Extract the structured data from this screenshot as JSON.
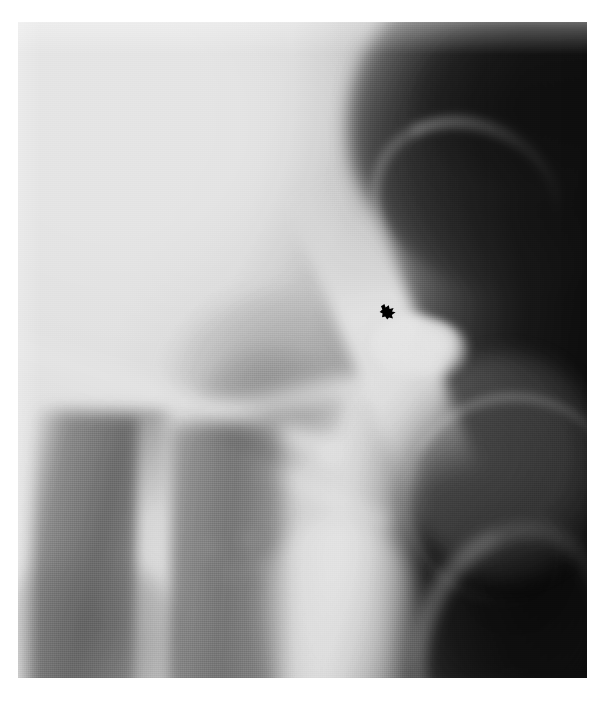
{
  "document": {
    "type": "medical-radiograph",
    "modality": "X-ray radiograph (grayscale film reproduction)",
    "caption": ""
  },
  "figure": {
    "page_width": 605,
    "page_height": 704,
    "background_color": "#ffffff",
    "plate": {
      "left": 18,
      "top": 22,
      "width": 569,
      "height": 656,
      "border": "none"
    }
  },
  "palette": {
    "paper_white": "#ffffff",
    "film_highlight": "#fdfdfd",
    "film_midtone": "#8a8a8a",
    "film_shadow": "#3a3a3a",
    "film_black": "#141414",
    "annotation_black": "#000000"
  },
  "annotations": [
    {
      "name": "arrow-marker",
      "glyph": "arrow-icon",
      "color": "#000000",
      "x": 361,
      "y": 281,
      "width": 18,
      "height": 17,
      "points_to": "contrast-opacity-blob",
      "direction": "down-right"
    }
  ],
  "regions": [
    {
      "name": "upper-left-lucent-field",
      "tone": "very-light",
      "approx_gray": "#fbfbfb"
    },
    {
      "name": "upper-right-dark-shadow",
      "tone": "dark",
      "approx_gray": "#1e1e1e"
    },
    {
      "name": "right-dark-column",
      "tone": "very-dark",
      "approx_gray": "#141414"
    },
    {
      "name": "bright-diagonal-cortex",
      "tone": "white",
      "approx_gray": "#ffffff"
    },
    {
      "name": "contrast-opacity-blob",
      "tone": "white",
      "approx_gray": "#ffffff"
    },
    {
      "name": "mid-grey-soft-tissue",
      "tone": "mid",
      "approx_gray": "#9a9a9a"
    },
    {
      "name": "left-shaft-dark-bands",
      "tone": "mid-dark",
      "approx_gray": "#6e6e6e"
    },
    {
      "name": "bottom-centre-bright-wedge",
      "tone": "light",
      "approx_gray": "#f0f0f0"
    }
  ]
}
